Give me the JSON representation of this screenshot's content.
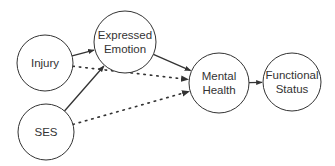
{
  "diagram": {
    "type": "path-diagram",
    "nodes": [
      {
        "id": "injury",
        "lines": [
          "Injury"
        ],
        "cx": 45,
        "cy": 63,
        "r": 28
      },
      {
        "id": "expressed-emotion",
        "lines": [
          "Expressed",
          "Emotion"
        ],
        "cx": 125,
        "cy": 42,
        "r": 31
      },
      {
        "id": "ses",
        "lines": [
          "SES"
        ],
        "cx": 46,
        "cy": 132,
        "r": 28
      },
      {
        "id": "mental-health",
        "lines": [
          "Mental",
          "Health"
        ],
        "cx": 219,
        "cy": 83,
        "r": 30
      },
      {
        "id": "functional-status",
        "lines": [
          "Functional",
          "Status"
        ],
        "cx": 292,
        "cy": 82,
        "r": 29
      }
    ],
    "edges": [
      {
        "from": "injury",
        "to": "expressed-emotion",
        "style": "solid"
      },
      {
        "from": "ses",
        "to": "expressed-emotion",
        "style": "solid"
      },
      {
        "from": "expressed-emotion",
        "to": "mental-health",
        "style": "solid"
      },
      {
        "from": "injury",
        "to": "mental-health",
        "style": "dotted"
      },
      {
        "from": "ses",
        "to": "mental-health",
        "style": "dotted"
      },
      {
        "from": "mental-health",
        "to": "functional-status",
        "style": "solid"
      }
    ],
    "colors": {
      "stroke": "#333333",
      "text": "#333333",
      "background": "#ffffff"
    }
  }
}
